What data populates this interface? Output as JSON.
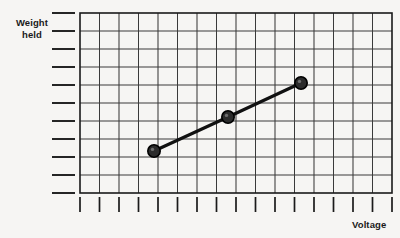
{
  "chart_data": {
    "type": "line",
    "title": "",
    "xlabel": "Voltage",
    "ylabel": "Weight held",
    "ylabel_lines": [
      "Weight",
      "held"
    ],
    "grid": true,
    "grid_columns": 16,
    "grid_rows": 10,
    "x_tick_count": 17,
    "y_tick_count": 11,
    "x_tick_labels": [],
    "y_tick_labels": [],
    "legend": null,
    "xlim": [
      0,
      16
    ],
    "ylim": [
      0,
      10
    ],
    "series": [
      {
        "name": "Weight held vs Voltage",
        "marker": "filled-circle",
        "x": [
          3.8,
          7.6,
          11.3
        ],
        "y": [
          2.3,
          4.2,
          6.1
        ]
      }
    ],
    "annotations": []
  },
  "style": {
    "background": "#f6f5f3",
    "grid_line_color": "#3a3a3a",
    "axis_color": "#1a1a1a",
    "series_color": "#111111",
    "marker_fill": "#2b2b2b",
    "marker_stroke": "#000000"
  },
  "geometry": {
    "plot_left": 80,
    "plot_top": 13,
    "plot_right": 392,
    "plot_bottom": 193,
    "cell_width": 19.5,
    "cell_height": 18,
    "y_tick_x_start": 52,
    "y_tick_x_end": 75,
    "x_tick_y_start": 197,
    "x_tick_y_end": 212,
    "points_px": [
      {
        "cx": 154,
        "cy": 151
      },
      {
        "cx": 228,
        "cy": 117
      },
      {
        "cx": 301,
        "cy": 83
      }
    ],
    "marker_radius": 6.2,
    "line_width": 3.2
  }
}
